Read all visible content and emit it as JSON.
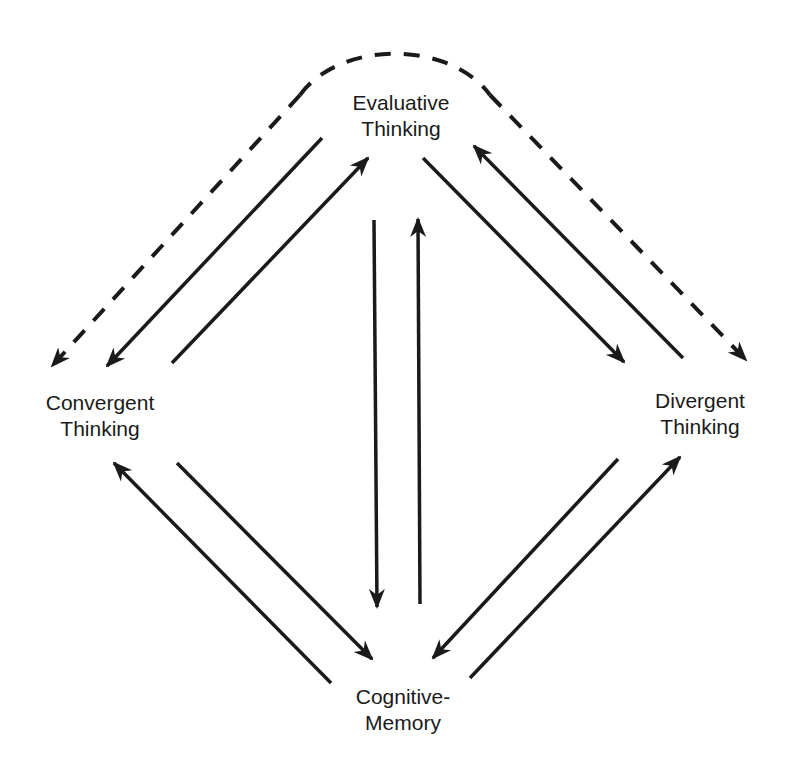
{
  "diagram": {
    "type": "flow",
    "colors": {
      "ink": "#1a1a1a",
      "background": "#ffffff"
    },
    "nodes": [
      {
        "id": "evaluative",
        "lines": [
          "Evaluative",
          "Thinking"
        ]
      },
      {
        "id": "convergent",
        "lines": [
          "Convergent",
          "Thinking"
        ]
      },
      {
        "id": "divergent",
        "lines": [
          "Divergent",
          "Thinking"
        ]
      },
      {
        "id": "cognitive",
        "lines": [
          "Cognitive-",
          "Memory"
        ]
      }
    ],
    "edges": [
      {
        "from": "evaluative",
        "to": "convergent",
        "style": "solid"
      },
      {
        "from": "convergent",
        "to": "evaluative",
        "style": "solid"
      },
      {
        "from": "evaluative",
        "to": "cognitive",
        "style": "solid"
      },
      {
        "from": "cognitive",
        "to": "evaluative",
        "style": "solid"
      },
      {
        "from": "evaluative",
        "to": "divergent",
        "style": "solid"
      },
      {
        "from": "divergent",
        "to": "evaluative",
        "style": "solid"
      },
      {
        "from": "convergent",
        "to": "cognitive",
        "style": "solid"
      },
      {
        "from": "cognitive",
        "to": "convergent",
        "style": "solid"
      },
      {
        "from": "divergent",
        "to": "cognitive",
        "style": "solid"
      },
      {
        "from": "cognitive",
        "to": "divergent",
        "style": "solid"
      },
      {
        "from": "evaluative",
        "to": "convergent",
        "style": "dashed",
        "curved": true,
        "bidirectional_arc": true
      },
      {
        "from": "evaluative",
        "to": "divergent",
        "style": "dashed",
        "curved": true,
        "bidirectional_arc": true
      }
    ]
  }
}
